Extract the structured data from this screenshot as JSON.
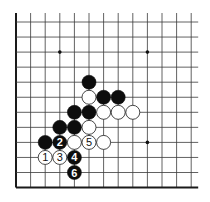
{
  "diagram": {
    "type": "go-board-fragment",
    "grid": {
      "columns": 13,
      "rows": 12,
      "origin_x": 16,
      "origin_y": 22,
      "spacing_x": 14.6,
      "spacing_y": 15.05,
      "open_top_extension": 9,
      "open_right_extension": 7,
      "left_edge_closed": true,
      "bottom_edge_closed": true
    },
    "star_points": [
      {
        "col": 3,
        "row": 2
      },
      {
        "col": 9,
        "row": 2
      },
      {
        "col": 9,
        "row": 8
      }
    ],
    "stones": [
      {
        "color": "black",
        "col": 5,
        "row": 4,
        "label": ""
      },
      {
        "color": "white",
        "col": 5,
        "row": 5,
        "label": ""
      },
      {
        "color": "black",
        "col": 6,
        "row": 5,
        "label": ""
      },
      {
        "color": "black",
        "col": 7,
        "row": 5,
        "label": ""
      },
      {
        "color": "black",
        "col": 4,
        "row": 6,
        "label": ""
      },
      {
        "color": "black",
        "col": 5,
        "row": 6,
        "label": ""
      },
      {
        "color": "white",
        "col": 6,
        "row": 6,
        "label": ""
      },
      {
        "color": "white",
        "col": 7,
        "row": 6,
        "label": ""
      },
      {
        "color": "white",
        "col": 8,
        "row": 6,
        "label": ""
      },
      {
        "color": "black",
        "col": 3,
        "row": 7,
        "label": ""
      },
      {
        "color": "black",
        "col": 4,
        "row": 7,
        "label": ""
      },
      {
        "color": "white",
        "col": 5,
        "row": 7,
        "label": ""
      },
      {
        "color": "black",
        "col": 2,
        "row": 8,
        "label": ""
      },
      {
        "color": "black",
        "col": 3,
        "row": 8,
        "label": "2"
      },
      {
        "color": "white",
        "col": 4,
        "row": 8,
        "label": ""
      },
      {
        "color": "white",
        "col": 5,
        "row": 8,
        "label": "5"
      },
      {
        "color": "white",
        "col": 6,
        "row": 8,
        "label": ""
      },
      {
        "color": "white",
        "col": 2,
        "row": 9,
        "label": "1"
      },
      {
        "color": "white",
        "col": 3,
        "row": 9,
        "label": "3"
      },
      {
        "color": "black",
        "col": 4,
        "row": 9,
        "label": "4"
      },
      {
        "color": "black",
        "col": 4,
        "row": 10,
        "label": "6"
      }
    ],
    "stone_radius": 7,
    "colors": {
      "black_stone": "#0d0d0d",
      "white_stone": "#ffffff",
      "grid": "#3a3a3a",
      "background": "#ffffff"
    }
  }
}
